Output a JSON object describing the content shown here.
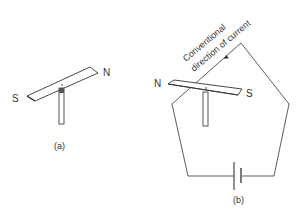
{
  "figure_a": {
    "label": "(a)",
    "pole_left": "S",
    "pole_right": "N"
  },
  "figure_b": {
    "label": "(b)",
    "pole_left": "N",
    "pole_right": "S",
    "annotation_line1": "Conventional",
    "annotation_line2": "direction of current"
  },
  "colors": {
    "line": "#333333",
    "background": "#ffffff"
  }
}
